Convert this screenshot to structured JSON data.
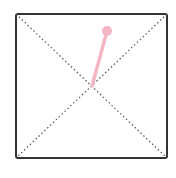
{
  "diagram": {
    "frame": {
      "x": 16,
      "y": 14,
      "width": 151,
      "height": 144,
      "stroke": "#333333",
      "radius": 2
    },
    "diagonals": {
      "stroke": "#555555",
      "dash": "1.5,2.5"
    },
    "center": {
      "x": 92,
      "y": 86
    },
    "handle": {
      "color": "#f4b6c2",
      "line_end": {
        "x": 107,
        "y": 31
      },
      "dot_radius": 5
    }
  }
}
